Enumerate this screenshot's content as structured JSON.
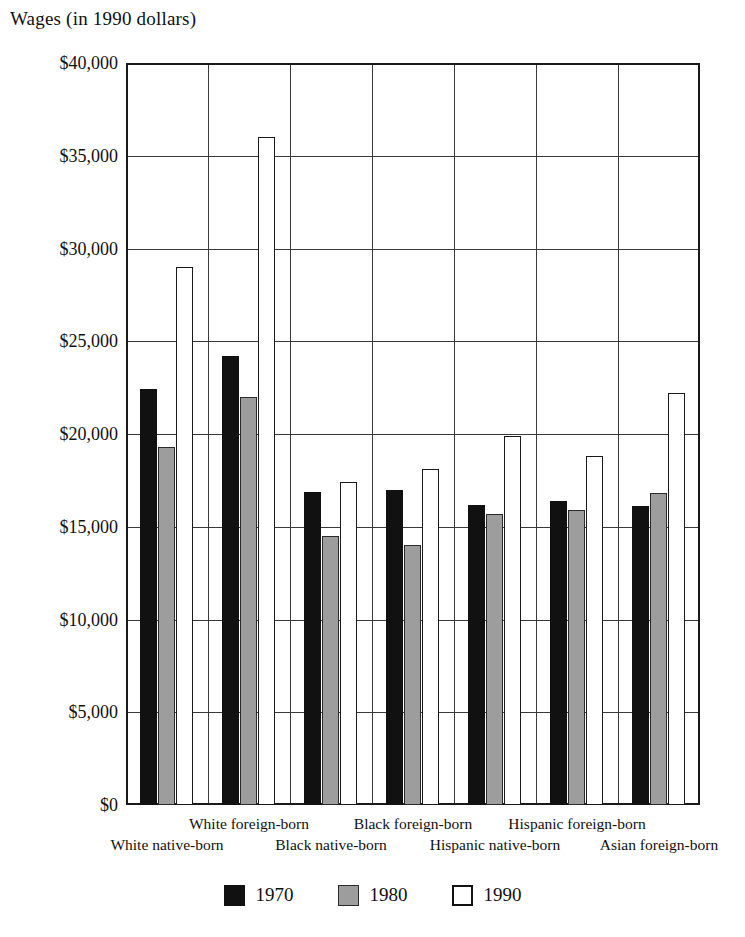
{
  "chart_data": {
    "type": "bar",
    "title": "Wages (in 1990 dollars)",
    "xlabel": "",
    "ylabel": "Wages (in 1990 dollars)",
    "ylim": [
      0,
      40000
    ],
    "ytick_step": 5000,
    "grid": true,
    "legend_position": "bottom-center",
    "categories": [
      "White native-born",
      "White foreign-born",
      "Black native-born",
      "Black foreign-born",
      "Hispanic native-born",
      "Hispanic foreign-born",
      "Asian foreign-born"
    ],
    "ytick_labels": [
      "$0",
      "$5,000",
      "$10,000",
      "$15,000",
      "$20,000",
      "$25,000",
      "$30,000",
      "$35,000",
      "$40,000"
    ],
    "ytick_values": [
      0,
      5000,
      10000,
      15000,
      20000,
      25000,
      30000,
      35000,
      40000
    ],
    "series": [
      {
        "name": "1970",
        "color": "#111111",
        "values": [
          22400,
          24200,
          16900,
          17000,
          16200,
          16400,
          16100
        ]
      },
      {
        "name": "1980",
        "color": "#9d9d9d",
        "values": [
          19300,
          22000,
          14500,
          14000,
          15700,
          15900,
          16800
        ]
      },
      {
        "name": "1990",
        "color": "#ffffff",
        "values": [
          29000,
          36000,
          17400,
          18100,
          19900,
          18800,
          22200
        ]
      }
    ]
  },
  "legend": {
    "items": [
      {
        "label": "1970",
        "swatch": "black-filled-square"
      },
      {
        "label": "1980",
        "swatch": "gray-filled-square"
      },
      {
        "label": "1990",
        "swatch": "white-outlined-square"
      }
    ]
  }
}
